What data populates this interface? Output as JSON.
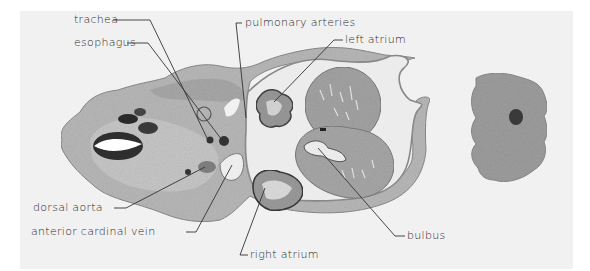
{
  "figure": {
    "type": "histological cross-section diagram",
    "labels": [
      {
        "id": "trachea",
        "text": "trachea",
        "x": 74,
        "y": 13
      },
      {
        "id": "esophagus",
        "text": "esophagus",
        "x": 74,
        "y": 36
      },
      {
        "id": "pulmonary-arteries",
        "text": "pulmonary arteries",
        "x": 245,
        "y": 16
      },
      {
        "id": "left-atrium",
        "text": "left atrium",
        "x": 345,
        "y": 33
      },
      {
        "id": "dorsal-aorta",
        "text": "dorsal aorta",
        "x": 33,
        "y": 201
      },
      {
        "id": "anterior-cardinal-vein",
        "text": "anterior cardinal vein",
        "x": 31,
        "y": 225
      },
      {
        "id": "right-atrium",
        "text": "right atrium",
        "x": 250,
        "y": 248
      },
      {
        "id": "bulbus",
        "text": "bulbus",
        "x": 407,
        "y": 229
      }
    ]
  }
}
